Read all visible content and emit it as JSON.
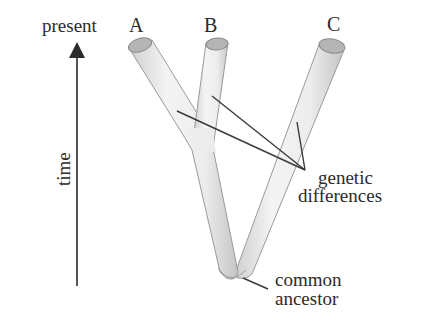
{
  "diagram": {
    "type": "phylogenetic-tree",
    "axis": {
      "top_label": "present",
      "side_label": "time",
      "direction": "up"
    },
    "branches": [
      {
        "id": "A",
        "label": "A"
      },
      {
        "id": "B",
        "label": "B"
      },
      {
        "id": "C",
        "label": "C"
      }
    ],
    "annotations": {
      "genetic_differences": {
        "line1": "genetic",
        "line2": "differences"
      },
      "common_ancestor": {
        "line1": "common",
        "line2": "ancestor"
      }
    },
    "colors": {
      "tube_fill": "#ececec",
      "tube_edge": "#9a9a9a",
      "cap_fill": "#b5b5b5",
      "text": "#2b2b2b",
      "lines": "#3a3a3a"
    }
  }
}
